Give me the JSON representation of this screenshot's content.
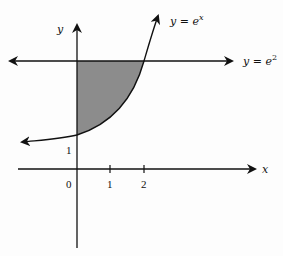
{
  "diagram": {
    "type": "function-graph-shaded-region",
    "axes": {
      "x_label": "x",
      "y_label": "y"
    },
    "curves": [
      {
        "name": "exponential",
        "label_text": "y = e",
        "label_exponent": "x"
      },
      {
        "name": "horizontal-line",
        "label_text": "y = e",
        "label_exponent": "2"
      }
    ],
    "ticks": {
      "origin": "0",
      "x_ticks": [
        "1",
        "2"
      ],
      "y_intercept": "1"
    },
    "shaded_region": {
      "bounded_by": [
        "y-axis",
        "y = e^x",
        "y = e^2"
      ],
      "fill": "#8c8c8c"
    },
    "colors": {
      "stroke": "#111111",
      "shade": "#8c8c8c"
    }
  }
}
